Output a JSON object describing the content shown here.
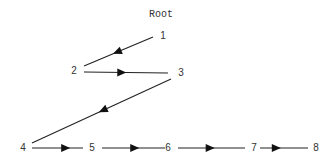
{
  "title": "Root",
  "nodes": [
    {
      "id": "1",
      "label": "1"
    },
    {
      "id": "2",
      "label": "2"
    },
    {
      "id": "3",
      "label": "3"
    },
    {
      "id": "4",
      "label": "4"
    },
    {
      "id": "5",
      "label": "5"
    },
    {
      "id": "6",
      "label": "6"
    },
    {
      "id": "7",
      "label": "7"
    },
    {
      "id": "8",
      "label": "8"
    }
  ],
  "edges": [
    {
      "from": "1",
      "to": "2"
    },
    {
      "from": "2",
      "to": "3"
    },
    {
      "from": "3",
      "to": "4"
    },
    {
      "from": "4",
      "to": "5"
    },
    {
      "from": "5",
      "to": "6"
    },
    {
      "from": "6",
      "to": "7"
    },
    {
      "from": "7",
      "to": "8"
    }
  ],
  "colors": {
    "line": "#222222",
    "text": "#333333",
    "background": "#ffffff"
  }
}
